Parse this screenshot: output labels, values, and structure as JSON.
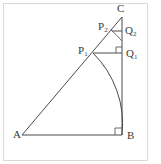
{
  "figure": {
    "kind": "geometry-diagram",
    "background_color": "#ffffff",
    "line_color": "#4a4a4a",
    "label_color": "#3a3a3a",
    "border_color": "#d9d9d9",
    "labels": {
      "A": "A",
      "B": "B",
      "C": "C",
      "P1_base": "P",
      "P1_sub": "1",
      "P2_base": "P",
      "P2_sub": "2",
      "Q1_base": "Q",
      "Q1_sub": "1",
      "Q2_base": "Q",
      "Q2_sub": "2"
    },
    "points": {
      "A": {
        "x": 22,
        "y": 135
      },
      "B": {
        "x": 122,
        "y": 135
      },
      "C": {
        "x": 122,
        "y": 17
      },
      "P1": {
        "x": 93,
        "y": 53
      },
      "P2": {
        "x": 112,
        "y": 31
      },
      "Q1": {
        "x": 122,
        "y": 53
      },
      "Q2": {
        "x": 122,
        "y": 31
      }
    },
    "segments": [
      {
        "name": "AB",
        "from": "A",
        "to": "B"
      },
      {
        "name": "BC",
        "from": "B",
        "to": "C"
      },
      {
        "name": "AC",
        "from": "A",
        "to": "C"
      },
      {
        "name": "P1Q1",
        "from": "P1",
        "to": "Q1"
      },
      {
        "name": "P2Q2",
        "from": "P2",
        "to": "Q2"
      }
    ],
    "arcs": [
      {
        "name": "arc-P1-B",
        "center": "A",
        "from": "P1",
        "to": "B",
        "radius": 100
      },
      {
        "name": "arc-P2-small",
        "center": "A",
        "from": "P2",
        "radius": 126
      }
    ],
    "right_angles": [
      {
        "name": "right-angle-at-B",
        "vertex": "B"
      },
      {
        "name": "right-angle-at-Q1",
        "vertex": "Q1"
      }
    ]
  }
}
